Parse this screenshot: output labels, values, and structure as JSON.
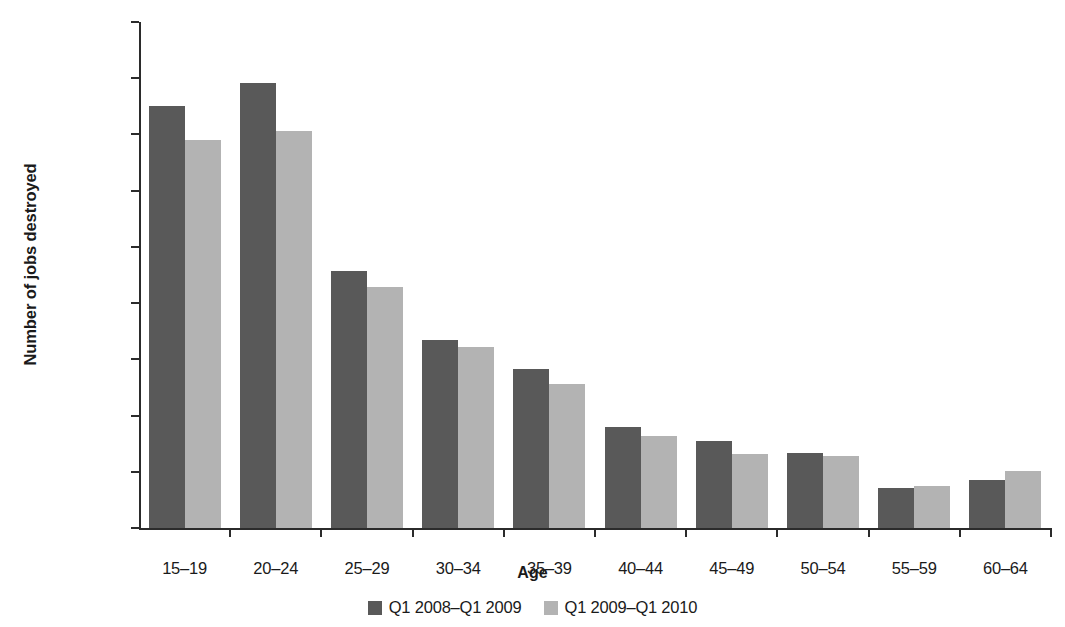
{
  "chart_data": {
    "type": "bar",
    "title": "",
    "xlabel": "Age",
    "ylabel": "Number of jobs destroyed",
    "categories": [
      "15–19",
      "20–24",
      "25–29",
      "30–34",
      "35–39",
      "40–44",
      "45–49",
      "50–54",
      "55–59",
      "60–64"
    ],
    "series": [
      {
        "name": "Q1 2008–Q1 2009",
        "color": "#595959",
        "values": [
          750000,
          791000,
          457000,
          334000,
          283000,
          180000,
          154000,
          133000,
          71000,
          85000
        ]
      },
      {
        "name": "Q1 2009–Q1 2010",
        "color": "#b3b3b3",
        "values": [
          691000,
          707000,
          428000,
          322000,
          256000,
          164000,
          131000,
          128000,
          75000,
          101000
        ]
      }
    ],
    "ylim": [
      0,
      900000
    ],
    "yticks": [
      0,
      100000,
      200000,
      300000,
      400000,
      500000,
      600000,
      700000,
      800000,
      900000
    ],
    "ytick_labels": [
      "0",
      "100,000",
      "200,000",
      "300,000",
      "400,000",
      "500,000",
      "600,000",
      "700,000",
      "800,000",
      "900,000"
    ],
    "grid": false,
    "legend_position": "bottom"
  },
  "legend": {
    "items": [
      {
        "label": "Q1 2008–Q1 2009",
        "color": "#595959"
      },
      {
        "label": "Q1 2009–Q1 2010",
        "color": "#b3b3b3"
      }
    ]
  }
}
